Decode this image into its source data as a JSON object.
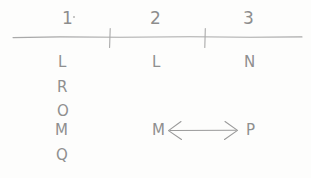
{
  "figure": {
    "kind": "hand-drawn-number-line-sketch",
    "background_color": "#fdfdfc",
    "ink_color": "#8f8f8f"
  },
  "axis": {
    "line_label": "horizontal-number-line",
    "start_x": 13,
    "end_x": 302,
    "y": 37,
    "ticks": [
      {
        "label": "tick-1",
        "x": 110
      },
      {
        "label": "tick-2",
        "x": 205
      }
    ]
  },
  "columns": [
    {
      "number": "1",
      "number_x": 62,
      "center_x": 66,
      "letters": [
        "L",
        "R",
        "O",
        "M",
        "Q"
      ]
    },
    {
      "number": "2",
      "number_x": 150,
      "center_x": 155,
      "letters": [
        "L"
      ]
    },
    {
      "number": "3",
      "number_x": 243,
      "center_x": 248,
      "letters": [
        "N"
      ]
    }
  ],
  "rows_y": [
    55,
    80,
    104,
    123,
    148
  ],
  "annotation": {
    "name": "double-headed-arrow",
    "left_label": "M",
    "right_label": "P",
    "left_label_x": 152,
    "right_label_x": 248,
    "y": 130,
    "arrow_start_x": 168,
    "arrow_end_x": 238,
    "description": "double-headed arrow drawn between M and P"
  },
  "stray_mark": {
    "name": "pencil-dot",
    "x": 73,
    "y": 16
  }
}
